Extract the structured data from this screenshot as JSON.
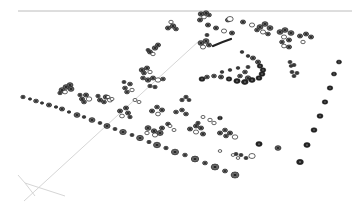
{
  "viewport": {
    "name": "3d-perspective-viewport",
    "background": "#ffffff",
    "symbol_color": "#222222",
    "guide_color": "#d6d6d6",
    "horizon_color": "#bcbcbc"
  },
  "guides": {
    "horizon": [
      18,
      11,
      352,
      11
    ],
    "axis_lines": [
      [
        [
          24,
          201
        ],
        [
          200,
          40
        ]
      ],
      [
        [
          18,
          175
        ],
        [
          25,
          183
        ]
      ],
      [
        [
          25,
          183
        ],
        [
          65,
          196
        ]
      ],
      [
        [
          25,
          183
        ],
        [
          35,
          196
        ]
      ]
    ]
  },
  "hedge_row_front": [
    [
      23,
      97,
      2.2
    ],
    [
      30,
      99,
      1.6
    ],
    [
      36,
      101,
      2.4
    ],
    [
      42,
      103,
      1.6
    ],
    [
      49,
      105,
      2.6
    ],
    [
      56,
      107,
      1.7
    ],
    [
      62,
      109,
      2.6
    ],
    [
      69,
      112,
      1.7
    ],
    [
      77,
      115,
      3.0
    ],
    [
      84,
      117,
      1.8
    ],
    [
      92,
      120,
      3.0
    ],
    [
      100,
      123,
      1.9
    ],
    [
      107,
      126,
      3.1
    ],
    [
      115,
      129,
      2.0
    ],
    [
      123,
      132,
      3.3
    ],
    [
      132,
      135,
      2.0
    ],
    [
      140,
      138,
      3.4
    ],
    [
      149,
      142,
      2.1
    ],
    [
      157,
      145,
      3.5
    ],
    [
      166,
      148,
      2.2
    ],
    [
      175,
      152,
      3.6
    ],
    [
      185,
      155,
      2.3
    ],
    [
      195,
      159,
      3.7
    ],
    [
      205,
      163,
      2.4
    ],
    [
      215,
      167,
      3.8
    ],
    [
      225,
      171,
      2.5
    ],
    [
      235,
      175,
      3.9
    ]
  ],
  "east_row": [
    [
      339,
      62,
      2.6
    ],
    [
      334,
      74,
      2.6
    ],
    [
      330,
      88,
      2.8
    ],
    [
      325,
      102,
      2.8
    ],
    [
      320,
      116,
      3.0
    ],
    [
      314,
      130,
      3.0
    ],
    [
      307,
      145,
      3.2
    ],
    [
      300,
      162,
      3.4
    ]
  ],
  "shrub_clusters": [
    {
      "name": "cluster-nw-1",
      "cx": 67,
      "cy": 88,
      "items": [
        [
          62,
          90,
          3
        ],
        [
          66,
          87,
          3
        ],
        [
          70,
          85,
          3
        ],
        [
          65,
          92,
          2.4
        ],
        [
          71,
          89,
          3
        ],
        [
          60,
          93,
          2.2
        ]
      ]
    },
    {
      "name": "cluster-nw-2",
      "cx": 85,
      "cy": 97,
      "items": [
        [
          82,
          99,
          2.6
        ],
        [
          86,
          95,
          2.6
        ],
        [
          84,
          102,
          2.4
        ],
        [
          89,
          99,
          2.8
        ],
        [
          80,
          95,
          2.2
        ]
      ]
    },
    {
      "name": "cluster-nw-3",
      "cx": 103,
      "cy": 98,
      "items": [
        [
          100,
          100,
          2.6
        ],
        [
          106,
          97,
          2.8
        ],
        [
          104,
          102,
          2.4
        ],
        [
          110,
          100,
          2.6
        ],
        [
          98,
          96,
          2.2
        ]
      ]
    },
    {
      "name": "cluster-mid-1",
      "cx": 128,
      "cy": 86,
      "items": [
        [
          125,
          88,
          2.4
        ],
        [
          130,
          84,
          2.4
        ],
        [
          127,
          92,
          2.4
        ],
        [
          132,
          90,
          2.2
        ],
        [
          124,
          82,
          2
        ]
      ]
    },
    {
      "name": "cluster-mid-2",
      "cx": 150,
      "cy": 80,
      "items": [
        [
          143,
          78,
          2.4
        ],
        [
          148,
          80,
          2.8
        ],
        [
          153,
          78,
          2.6
        ],
        [
          158,
          80,
          2.8
        ],
        [
          163,
          79,
          2.4
        ],
        [
          150,
          86,
          2.2
        ],
        [
          155,
          87,
          2.2
        ]
      ]
    },
    {
      "name": "cluster-mid-3",
      "cx": 146,
      "cy": 70,
      "items": [
        [
          142,
          70,
          2.8
        ],
        [
          147,
          68,
          2.6
        ],
        [
          144,
          73,
          2.4
        ],
        [
          150,
          72,
          2.2
        ]
      ]
    },
    {
      "name": "cluster-upper-1",
      "cx": 156,
      "cy": 50,
      "items": [
        [
          150,
          52,
          2.6
        ],
        [
          155,
          48,
          2.8
        ],
        [
          158,
          45,
          2.6
        ],
        [
          153,
          54,
          2.2
        ],
        [
          148,
          50,
          2
        ]
      ]
    },
    {
      "name": "cluster-upper-2",
      "cx": 172,
      "cy": 28,
      "items": [
        [
          168,
          28,
          2.6
        ],
        [
          173,
          26,
          2.8
        ],
        [
          176,
          29,
          2.4
        ],
        [
          171,
          22,
          2.2
        ]
      ]
    },
    {
      "name": "cluster-upper-3",
      "cx": 203,
      "cy": 15,
      "items": [
        [
          201,
          14,
          2.8
        ],
        [
          206,
          13,
          2.8
        ],
        [
          209,
          15,
          2.4
        ],
        [
          204,
          17,
          2.4
        ]
      ]
    },
    {
      "name": "cluster-upper-row",
      "cx": 215,
      "cy": 28,
      "items": [
        [
          200,
          20,
          2.6
        ],
        [
          208,
          25,
          2.6
        ],
        [
          216,
          28,
          2.6
        ],
        [
          224,
          31,
          2.6
        ],
        [
          232,
          33,
          2.6
        ],
        [
          228,
          20,
          2.6
        ],
        [
          243,
          22,
          2.6
        ],
        [
          252,
          25,
          2.6
        ]
      ]
    },
    {
      "name": "cluster-ne-1",
      "cx": 264,
      "cy": 28,
      "items": [
        [
          260,
          27,
          3
        ],
        [
          265,
          24,
          3
        ],
        [
          270,
          28,
          3
        ],
        [
          263,
          32,
          2.6
        ],
        [
          268,
          34,
          2.4
        ],
        [
          257,
          30,
          2.4
        ]
      ]
    },
    {
      "name": "cluster-ne-2",
      "cx": 285,
      "cy": 34,
      "items": [
        [
          280,
          32,
          3
        ],
        [
          285,
          30,
          3
        ],
        [
          291,
          33,
          3
        ],
        [
          284,
          37,
          2.6
        ],
        [
          289,
          40,
          2.6
        ],
        [
          282,
          42,
          2.4
        ],
        [
          289,
          47,
          2.6
        ],
        [
          284,
          46,
          2.4
        ]
      ]
    },
    {
      "name": "cluster-ne-3",
      "cx": 305,
      "cy": 38,
      "items": [
        [
          300,
          36,
          2.6
        ],
        [
          306,
          34,
          2.6
        ],
        [
          311,
          37,
          2.6
        ],
        [
          303,
          42,
          2.2
        ]
      ]
    },
    {
      "name": "cluster-left-of-arc",
      "cx": 206,
      "cy": 43,
      "items": [
        [
          201,
          43,
          3
        ],
        [
          206,
          41,
          3
        ],
        [
          209,
          45,
          2.6
        ],
        [
          203,
          47,
          2.6
        ],
        [
          207,
          35,
          2
        ]
      ]
    },
    {
      "name": "cluster-mid-right",
      "cx": 245,
      "cy": 75,
      "items": [
        [
          240,
          76,
          2.4
        ],
        [
          245,
          72,
          2.4
        ],
        [
          248,
          78,
          2.8
        ],
        [
          244,
          82,
          2.6
        ]
      ]
    },
    {
      "name": "cluster-right-small",
      "cx": 296,
      "cy": 72,
      "items": [
        [
          292,
          72,
          2
        ],
        [
          297,
          73,
          2
        ],
        [
          294,
          76,
          2
        ]
      ]
    },
    {
      "name": "cluster-ne-small",
      "cx": 293,
      "cy": 62,
      "items": [
        [
          290,
          62,
          2
        ],
        [
          294,
          65,
          2
        ],
        [
          291,
          66,
          1.8
        ]
      ]
    },
    {
      "name": "cluster-center-1",
      "cx": 125,
      "cy": 110,
      "items": [
        [
          120,
          111,
          2.6
        ],
        [
          126,
          108,
          2.6
        ],
        [
          128,
          113,
          2.6
        ],
        [
          122,
          116,
          2.4
        ],
        [
          130,
          117,
          2.2
        ]
      ]
    },
    {
      "name": "cluster-center-2",
      "cx": 157,
      "cy": 109,
      "items": [
        [
          152,
          111,
          2.6
        ],
        [
          157,
          107,
          2.4
        ],
        [
          162,
          110,
          2.6
        ],
        [
          158,
          114,
          2.4
        ]
      ]
    },
    {
      "name": "cluster-center-3",
      "cx": 185,
      "cy": 98,
      "items": [
        [
          182,
          100,
          2.2
        ],
        [
          186,
          97,
          2.2
        ],
        [
          189,
          100,
          2
        ]
      ]
    },
    {
      "name": "cluster-center-4",
      "cx": 150,
      "cy": 130,
      "items": [
        [
          148,
          128,
          3
        ],
        [
          154,
          131,
          2.8
        ],
        [
          160,
          133,
          3.2
        ],
        [
          155,
          135,
          2.6
        ],
        [
          162,
          128,
          2.6
        ],
        [
          168,
          124,
          2.4
        ]
      ]
    },
    {
      "name": "cluster-center-5",
      "cx": 195,
      "cy": 128,
      "items": [
        [
          190,
          129,
          2.6
        ],
        [
          196,
          126,
          2.6
        ],
        [
          201,
          128,
          2.6
        ],
        [
          196,
          132,
          2.6
        ],
        [
          203,
          134,
          2.6
        ],
        [
          198,
          123,
          2.2
        ]
      ]
    },
    {
      "name": "cluster-center-6",
      "cx": 226,
      "cy": 133,
      "items": [
        [
          220,
          133,
          2.6
        ],
        [
          225,
          130,
          2.4
        ],
        [
          230,
          133,
          2.6
        ],
        [
          235,
          137,
          2.8
        ],
        [
          226,
          136,
          2.4
        ]
      ]
    },
    {
      "name": "cluster-center-7",
      "cx": 180,
      "cy": 112,
      "items": [
        [
          176,
          112,
          2.4
        ],
        [
          182,
          110,
          2.4
        ],
        [
          186,
          114,
          2.4
        ]
      ]
    },
    {
      "name": "cluster-lower-right",
      "cx": 250,
      "cy": 155,
      "items": [
        [
          236,
          154,
          2
        ],
        [
          241,
          155,
          2
        ],
        [
          246,
          158,
          2
        ],
        [
          252,
          156,
          3.2
        ]
      ]
    }
  ],
  "arc_bed": {
    "name": "crescent-planting-bed",
    "items": [
      [
        242,
        52,
        1.8
      ],
      [
        248,
        56,
        1.8
      ],
      [
        253,
        58,
        2.6
      ],
      [
        258,
        62,
        2.6
      ],
      [
        260,
        66,
        2.8
      ],
      [
        263,
        70,
        2.8
      ],
      [
        262,
        74,
        3
      ],
      [
        259,
        78,
        3
      ],
      [
        252,
        80,
        3.2
      ],
      [
        245,
        82,
        3.2
      ],
      [
        237,
        81,
        3.2
      ],
      [
        229,
        79,
        2.8
      ],
      [
        221,
        77,
        2.6
      ],
      [
        214,
        76,
        2.4
      ],
      [
        207,
        77,
        2.4
      ],
      [
        202,
        79,
        3
      ],
      [
        222,
        72,
        1.8
      ],
      [
        230,
        70,
        1.8
      ],
      [
        238,
        68,
        1.8
      ],
      [
        248,
        67,
        2
      ]
    ]
  },
  "curved_path": {
    "name": "curved-path-segment",
    "d": "M213 46 Q222 42 231 39"
  },
  "feature_markers": [
    {
      "name": "open-circle-marker",
      "x": 230,
      "y": 19,
      "r": 3.2
    },
    {
      "name": "solid-tree-marker",
      "x": 259,
      "y": 144,
      "r": 3.2
    },
    {
      "name": "hatched-tree-marker",
      "x": 278,
      "y": 148,
      "r": 3
    },
    {
      "name": "solid-tree-marker-2",
      "x": 220,
      "y": 118,
      "r": 2.4
    },
    {
      "name": "open-circle-chain",
      "x": 220,
      "y": 151,
      "r": 1.8
    }
  ],
  "open_circles": [
    [
      108,
      97,
      2
    ],
    [
      112,
      99,
      2
    ],
    [
      135,
      100,
      2
    ],
    [
      139,
      102,
      2
    ],
    [
      210,
      120,
      2.2
    ],
    [
      214,
      123,
      2.2
    ],
    [
      203,
      117,
      2
    ],
    [
      233,
      155,
      1.8
    ],
    [
      238,
      158,
      1.8
    ],
    [
      147,
      133,
      2.2
    ],
    [
      170,
      126,
      2
    ],
    [
      174,
      130,
      2
    ]
  ]
}
